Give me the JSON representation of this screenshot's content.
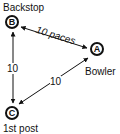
{
  "diagram": {
    "nodes": [
      {
        "id": "B",
        "letter": "B",
        "label": "Backstop"
      },
      {
        "id": "A",
        "letter": "A",
        "label": "Bowler"
      },
      {
        "id": "C",
        "letter": "C",
        "label": "1st post"
      }
    ],
    "edges": [
      {
        "from": "B",
        "to": "A",
        "label": "10 paces"
      },
      {
        "from": "B",
        "to": "C",
        "label": "10"
      },
      {
        "from": "A",
        "to": "C",
        "label": "10"
      }
    ]
  }
}
